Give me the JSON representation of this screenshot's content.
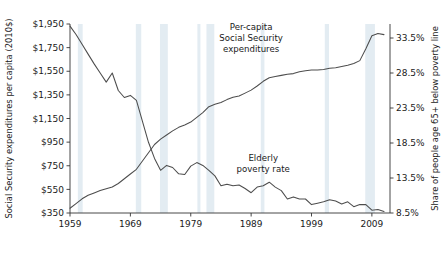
{
  "chart_data": {
    "type": "line",
    "title": "",
    "xlabel": "",
    "ylabel": "Social Security expenditures per capita (2010$)",
    "y2label": "Share of people age 65+ below poverty line",
    "xlim": [
      1959,
      2012
    ],
    "ylim": [
      350,
      1950
    ],
    "y2lim": [
      8.5,
      35.5
    ],
    "grid": false,
    "legend": "annotations-on-plot",
    "x_ticks": [
      "1959",
      "1969",
      "1979",
      "1989",
      "1999",
      "2009"
    ],
    "x_tick_values": [
      1959,
      1969,
      1979,
      1989,
      1999,
      2009
    ],
    "y_ticks": [
      "$350",
      "$550",
      "$750",
      "$950",
      "$1,150",
      "$1,350",
      "$1,550",
      "$1,750",
      "$1,950"
    ],
    "y_tick_values": [
      350,
      550,
      750,
      950,
      1150,
      1350,
      1550,
      1750,
      1950
    ],
    "y2_ticks": [
      "8.5%",
      "13.5%",
      "18.5%",
      "23.5%",
      "28.5%",
      "33.5%"
    ],
    "y2_tick_values": [
      8.5,
      13.5,
      18.5,
      23.5,
      28.5,
      33.5
    ],
    "annotations": [
      {
        "name": "expenditures-annotation",
        "lines": [
          "Per-capita",
          "Social Security",
          "expenditures"
        ],
        "x": 1989,
        "y": 1900
      },
      {
        "name": "poverty-annotation",
        "lines": [
          "Elderly",
          "poverty rate"
        ],
        "x": 1991,
        "y": 790
      }
    ],
    "recession_bands": [
      {
        "start": 1960.3,
        "end": 1961.1
      },
      {
        "start": 1969.9,
        "end": 1970.8
      },
      {
        "start": 1973.9,
        "end": 1975.2
      },
      {
        "start": 1980.1,
        "end": 1980.6
      },
      {
        "start": 1981.6,
        "end": 1982.9
      },
      {
        "start": 1990.6,
        "end": 1991.2
      },
      {
        "start": 2001.2,
        "end": 2001.9
      },
      {
        "start": 2007.9,
        "end": 2009.5
      }
    ],
    "series": [
      {
        "name": "Per-capita Social Security expenditures",
        "axis": "left",
        "units": "2010 dollars per capita",
        "color": "#4d4d4d",
        "x": [
          1959,
          1960,
          1961,
          1962,
          1963,
          1964,
          1965,
          1966,
          1967,
          1968,
          1969,
          1970,
          1971,
          1972,
          1973,
          1974,
          1975,
          1976,
          1977,
          1978,
          1979,
          1980,
          1981,
          1982,
          1983,
          1984,
          1985,
          1986,
          1987,
          1988,
          1989,
          1990,
          1991,
          1992,
          1993,
          1994,
          1995,
          1996,
          1997,
          1998,
          1999,
          2000,
          2001,
          2002,
          2003,
          2004,
          2005,
          2006,
          2007,
          2008,
          2009,
          2010,
          2011
        ],
        "values": [
          390,
          430,
          470,
          500,
          520,
          540,
          555,
          570,
          600,
          640,
          680,
          720,
          790,
          860,
          930,
          975,
          1010,
          1045,
          1075,
          1095,
          1120,
          1160,
          1200,
          1250,
          1270,
          1285,
          1310,
          1330,
          1340,
          1365,
          1390,
          1425,
          1465,
          1495,
          1505,
          1515,
          1525,
          1530,
          1545,
          1555,
          1560,
          1560,
          1565,
          1575,
          1580,
          1590,
          1600,
          1615,
          1640,
          1740,
          1850,
          1870,
          1860
        ]
      },
      {
        "name": "Elderly poverty rate",
        "axis": "right",
        "units": "percent of people age 65+ below poverty line",
        "color": "#4d4d4d",
        "x": [
          1959,
          1960,
          1961,
          1962,
          1963,
          1964,
          1965,
          1966,
          1967,
          1968,
          1969,
          1970,
          1971,
          1972,
          1973,
          1974,
          1975,
          1976,
          1977,
          1978,
          1979,
          1980,
          1981,
          1982,
          1983,
          1984,
          1985,
          1986,
          1987,
          1988,
          1989,
          1990,
          1991,
          1992,
          1993,
          1994,
          1995,
          1996,
          1997,
          1998,
          1999,
          2000,
          2001,
          2002,
          2003,
          2004,
          2005,
          2006,
          2007,
          2008,
          2009,
          2010,
          2011
        ],
        "values": [
          35.2,
          34.0,
          32.6,
          31.2,
          29.8,
          28.5,
          27.2,
          28.5,
          26.0,
          25.0,
          25.3,
          24.6,
          21.6,
          18.6,
          16.3,
          14.6,
          15.3,
          15.0,
          14.1,
          14.0,
          15.2,
          15.7,
          15.3,
          14.6,
          13.8,
          12.4,
          12.6,
          12.4,
          12.5,
          12.0,
          11.4,
          12.2,
          12.4,
          12.9,
          12.2,
          11.7,
          10.5,
          10.8,
          10.5,
          10.5,
          9.7,
          9.9,
          10.1,
          10.4,
          10.2,
          9.8,
          10.1,
          9.4,
          9.7,
          9.7,
          8.9,
          9.0,
          8.7
        ]
      }
    ]
  }
}
